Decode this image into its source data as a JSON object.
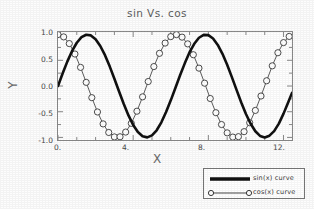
{
  "chart_data": {
    "type": "line",
    "title": "sin Vs. cos",
    "xlabel": "X",
    "ylabel": "Y",
    "xlim": [
      0,
      12.45
    ],
    "ylim": [
      -1.05,
      1.05
    ],
    "grid": false,
    "legend_position": "outside bottom-right",
    "xticks": [
      {
        "value": 0,
        "label": "0."
      },
      {
        "value": 4,
        "label": "4."
      },
      {
        "value": 8,
        "label": "8."
      },
      {
        "value": 12,
        "label": "12."
      }
    ],
    "yticks": [
      {
        "value": 1.0,
        "label": "1.0"
      },
      {
        "value": 0.5,
        "label": "0.5"
      },
      {
        "value": 0.0,
        "label": "0.0"
      },
      {
        "value": -0.5,
        "label": "-0.5"
      },
      {
        "value": -1.0,
        "label": "-1.0"
      }
    ],
    "series": [
      {
        "name": "sin(x) curve",
        "function": "sin(x)",
        "style": "thick-solid-line",
        "color": "#111111",
        "linewidth": 2.6,
        "marker": "none",
        "x": [
          0,
          0.25,
          0.5,
          0.75,
          1,
          1.25,
          1.5,
          1.75,
          2,
          2.25,
          2.5,
          2.75,
          3,
          3.25,
          3.5,
          3.75,
          4,
          4.25,
          4.5,
          4.75,
          5,
          5.25,
          5.5,
          5.75,
          6,
          6.25,
          6.5,
          6.75,
          7,
          7.25,
          7.5,
          7.75,
          8,
          8.25,
          8.5,
          8.75,
          9,
          9.25,
          9.5,
          9.75,
          10,
          10.25,
          10.5,
          10.75,
          11,
          11.25,
          11.5,
          11.75,
          12,
          12.25,
          12.45
        ],
        "y": [
          0,
          0.247,
          0.479,
          0.682,
          0.841,
          0.949,
          0.997,
          0.984,
          0.909,
          0.778,
          0.599,
          0.382,
          0.141,
          -0.108,
          -0.351,
          -0.572,
          -0.757,
          -0.895,
          -0.978,
          -0.999,
          -0.959,
          -0.861,
          -0.706,
          -0.504,
          -0.279,
          -0.034,
          0.215,
          0.445,
          0.657,
          0.82,
          0.938,
          0.994,
          0.989,
          0.923,
          0.798,
          0.625,
          0.412,
          0.172,
          -0.075,
          -0.321,
          -0.544,
          -0.733,
          -0.88,
          -0.97,
          -1,
          -0.966,
          -0.878,
          -0.731,
          -0.537,
          -0.314,
          -0.134
        ]
      },
      {
        "name": "cos(x) curve",
        "function": "cos(x)",
        "style": "thin-line-with-open-circle-markers",
        "color": "#333333",
        "linewidth": 0.8,
        "marker": "open-circle",
        "marker_size": 3.1,
        "x": [
          0,
          0.3,
          0.6,
          0.9,
          1.2,
          1.5,
          1.8,
          2.1,
          2.4,
          2.7,
          3,
          3.3,
          3.6,
          3.9,
          4.2,
          4.5,
          4.8,
          5.1,
          5.4,
          5.7,
          6,
          6.3,
          6.6,
          6.9,
          7.2,
          7.5,
          7.8,
          8.1,
          8.4,
          8.7,
          9,
          9.3,
          9.6,
          9.9,
          10.2,
          10.5,
          10.8,
          11.1,
          11.4,
          11.7,
          12,
          12.3
        ],
        "y": [
          1,
          0.955,
          0.825,
          0.622,
          0.362,
          0.071,
          -0.227,
          -0.505,
          -0.737,
          -0.904,
          -0.99,
          -0.987,
          -0.896,
          -0.726,
          -0.49,
          -0.211,
          0.087,
          0.378,
          0.635,
          0.835,
          0.96,
          0.999,
          0.95,
          0.819,
          0.608,
          0.347,
          0.055,
          -0.243,
          -0.519,
          -0.749,
          -0.911,
          -0.993,
          -0.985,
          -0.888,
          -0.714,
          -0.475,
          -0.195,
          0.102,
          0.392,
          0.647,
          0.844,
          0.964
        ]
      }
    ]
  },
  "legend": {
    "sin_label": "sin(x) curve",
    "cos_label": "cos(x) curve"
  },
  "colors": {
    "sin_curve": "#111111",
    "cos_curve": "#333333",
    "frame": "#8a8a8a",
    "text": "#4a4a4a",
    "background": "#fdfdfd"
  }
}
